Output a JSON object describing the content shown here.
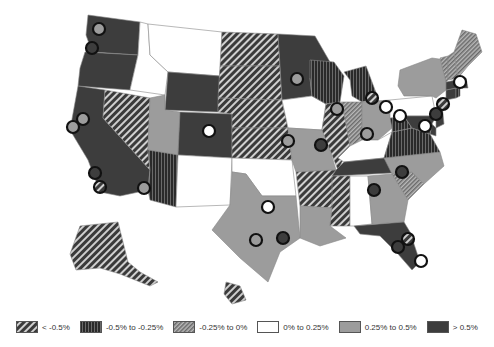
{
  "map": {
    "title": "",
    "colors": {
      "lt_m05": "#4a4a4a",
      "m05_m025": "#2e2e2e",
      "m025_0": "#7a7a7a",
      "0_025": "#ffffff",
      "025_05": "#9c9c9c",
      "gt_05": "#3d3d3d",
      "stroke": "#888888"
    }
  },
  "legend": {
    "items": [
      {
        "label": "< -0.5%",
        "pattern": "diag-dark"
      },
      {
        "label": "-0.5% to -0.25%",
        "pattern": "vert-dark"
      },
      {
        "label": "-0.25% to 0%",
        "pattern": "diag-light"
      },
      {
        "label": "0% to 0.25%",
        "pattern": "white"
      },
      {
        "label": "0.25% to 0.5%",
        "pattern": "gray"
      },
      {
        "label": "> 0.5%",
        "pattern": "dark"
      }
    ]
  },
  "states": [
    {
      "id": "WA",
      "cat": "gt_05"
    },
    {
      "id": "OR",
      "cat": "gt_05"
    },
    {
      "id": "CA",
      "cat": "gt_05"
    },
    {
      "id": "ID",
      "cat": "0_025"
    },
    {
      "id": "MT",
      "cat": "0_025"
    },
    {
      "id": "WY",
      "cat": "gt_05"
    },
    {
      "id": "NV",
      "cat": "lt_m05"
    },
    {
      "id": "UT",
      "cat": "025_05"
    },
    {
      "id": "AZ",
      "cat": "m05_m025"
    },
    {
      "id": "CO",
      "cat": "gt_05"
    },
    {
      "id": "NM",
      "cat": "0_025"
    },
    {
      "id": "ND",
      "cat": "lt_m05"
    },
    {
      "id": "SD",
      "cat": "lt_m05"
    },
    {
      "id": "NE",
      "cat": "lt_m05"
    },
    {
      "id": "KS",
      "cat": "lt_m05"
    },
    {
      "id": "OK",
      "cat": "0_025"
    },
    {
      "id": "TX",
      "cat": "025_05"
    },
    {
      "id": "MN",
      "cat": "gt_05"
    },
    {
      "id": "IA",
      "cat": "0_025"
    },
    {
      "id": "MO",
      "cat": "025_05"
    },
    {
      "id": "AR",
      "cat": "lt_m05"
    },
    {
      "id": "LA",
      "cat": "025_05"
    },
    {
      "id": "WI",
      "cat": "m05_m025"
    },
    {
      "id": "IL",
      "cat": "lt_m05"
    },
    {
      "id": "MI",
      "cat": "m05_m025"
    },
    {
      "id": "IN",
      "cat": "m025_0"
    },
    {
      "id": "OH",
      "cat": "025_05"
    },
    {
      "id": "KY",
      "cat": "0_025"
    },
    {
      "id": "TN",
      "cat": "gt_05"
    },
    {
      "id": "MS",
      "cat": "lt_m05"
    },
    {
      "id": "AL",
      "cat": "0_025"
    },
    {
      "id": "GA",
      "cat": "025_05"
    },
    {
      "id": "FL",
      "cat": "gt_05"
    },
    {
      "id": "SC",
      "cat": "m025_0"
    },
    {
      "id": "NC",
      "cat": "025_05"
    },
    {
      "id": "VA",
      "cat": "m05_m025"
    },
    {
      "id": "WV",
      "cat": "m05_m025"
    },
    {
      "id": "PA",
      "cat": "0_025"
    },
    {
      "id": "NY",
      "cat": "025_05"
    },
    {
      "id": "NJ",
      "cat": "gt_05"
    },
    {
      "id": "DE",
      "cat": "gt_05"
    },
    {
      "id": "MD",
      "cat": "gt_05"
    },
    {
      "id": "CT",
      "cat": "gt_05"
    },
    {
      "id": "RI",
      "cat": "m05_m025"
    },
    {
      "id": "MA",
      "cat": "gt_05"
    },
    {
      "id": "VT",
      "cat": "m025_0"
    },
    {
      "id": "NH",
      "cat": "m025_0"
    },
    {
      "id": "ME",
      "cat": "m025_0"
    },
    {
      "id": "AK",
      "cat": "lt_m05"
    },
    {
      "id": "HI",
      "cat": "lt_m05"
    }
  ],
  "cities": [
    {
      "name": "Seattle",
      "x": 99,
      "y": 29,
      "fill": "025_05"
    },
    {
      "name": "Portland",
      "x": 92,
      "y": 48,
      "fill": "gt_05"
    },
    {
      "name": "San Francisco",
      "x": 83,
      "y": 119,
      "fill": "025_05"
    },
    {
      "name": "San Jose",
      "x": 73,
      "y": 127,
      "fill": "025_05"
    },
    {
      "name": "Los Angeles",
      "x": 95,
      "y": 173,
      "fill": "gt_05"
    },
    {
      "name": "San Diego",
      "x": 100,
      "y": 187,
      "fill": "lt_m05"
    },
    {
      "name": "Phoenix",
      "x": 144,
      "y": 188,
      "fill": "025_05"
    },
    {
      "name": "Denver",
      "x": 209,
      "y": 131,
      "fill": "0_025"
    },
    {
      "name": "Minneapolis",
      "x": 297,
      "y": 79,
      "fill": "025_05"
    },
    {
      "name": "Kansas City",
      "x": 288,
      "y": 141,
      "fill": "025_05"
    },
    {
      "name": "St Louis",
      "x": 321,
      "y": 145,
      "fill": "gt_05"
    },
    {
      "name": "Chicago",
      "x": 337,
      "y": 109,
      "fill": "025_05"
    },
    {
      "name": "Detroit",
      "x": 372,
      "y": 98,
      "fill": "lt_m05"
    },
    {
      "name": "Cleveland",
      "x": 386,
      "y": 107,
      "fill": "0_025"
    },
    {
      "name": "Pittsburgh",
      "x": 400,
      "y": 116,
      "fill": "0_025"
    },
    {
      "name": "Cincinnati",
      "x": 367,
      "y": 134,
      "fill": "025_05"
    },
    {
      "name": "Philadelphia",
      "x": 425,
      "y": 126,
      "fill": "0_025"
    },
    {
      "name": "New York",
      "x": 436,
      "y": 114,
      "fill": "gt_05"
    },
    {
      "name": "Boston",
      "x": 460,
      "y": 82,
      "fill": "0_025"
    },
    {
      "name": "Hartford",
      "x": 443,
      "y": 104,
      "fill": "lt_m05"
    },
    {
      "name": "Dallas",
      "x": 268,
      "y": 207,
      "fill": "0_025"
    },
    {
      "name": "Houston",
      "x": 283,
      "y": 238,
      "fill": "gt_05"
    },
    {
      "name": "San Antonio",
      "x": 256,
      "y": 240,
      "fill": "025_05"
    },
    {
      "name": "Atlanta",
      "x": 374,
      "y": 190,
      "fill": "gt_05"
    },
    {
      "name": "Charlotte",
      "x": 402,
      "y": 172,
      "fill": "gt_05"
    },
    {
      "name": "Jacksonville",
      "x": 408,
      "y": 239,
      "fill": "lt_m05"
    },
    {
      "name": "Tampa",
      "x": 398,
      "y": 247,
      "fill": "gt_05"
    },
    {
      "name": "Miami",
      "x": 421,
      "y": 261,
      "fill": "0_025"
    }
  ]
}
